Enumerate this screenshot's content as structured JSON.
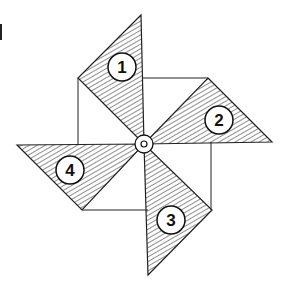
{
  "figure": {
    "hatch_color": "#333333",
    "line_color": "#222222",
    "background": "#ffffff",
    "center": {
      "x": 144,
      "y": 144,
      "outer_r": 9,
      "inner_r": 3
    },
    "square": {
      "x1": 80,
      "y1": 78,
      "x2": 211,
      "y2": 210
    },
    "blades": [
      {
        "label": "1",
        "points": "141,15 78,78 144,144",
        "circle": {
          "cx": 122,
          "cy": 67,
          "r": 14
        }
      },
      {
        "label": "2",
        "points": "208,78 272,142 144,144",
        "circle": {
          "cx": 219,
          "cy": 120,
          "r": 14
        }
      },
      {
        "label": "3",
        "points": "212,210 148,275 144,144",
        "circle": {
          "cx": 171,
          "cy": 220,
          "r": 14
        }
      },
      {
        "label": "4",
        "points": "17,145 82,210 144,144",
        "circle": {
          "cx": 70,
          "cy": 170,
          "r": 14
        }
      }
    ]
  }
}
